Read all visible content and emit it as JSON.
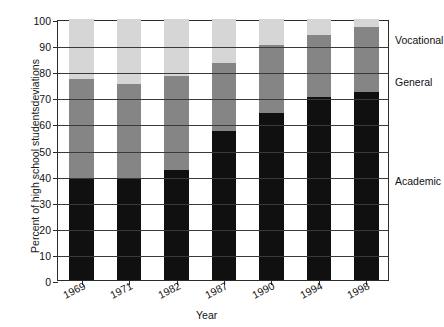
{
  "chart_data": {
    "type": "bar",
    "stacked": true,
    "title": "",
    "xlabel": "Year",
    "ylabel": "Percent of high school studentsdeviations",
    "categories": [
      "1969",
      "1971",
      "1982",
      "1987",
      "1990",
      "1994",
      "1998"
    ],
    "ylim": [
      0,
      100
    ],
    "yticks": [
      0,
      10,
      20,
      30,
      40,
      50,
      60,
      70,
      80,
      90,
      100
    ],
    "grid": true,
    "legend_position": "right-outside",
    "series": [
      {
        "name": "Academic",
        "color": "#101010",
        "values": [
          39,
          39,
          42,
          57,
          64,
          70,
          72
        ]
      },
      {
        "name": "General",
        "color": "#858585",
        "values": [
          38,
          36,
          36,
          26,
          26,
          24,
          25
        ]
      },
      {
        "name": "Vocational",
        "color": "#d6d6d6",
        "values": [
          23,
          25,
          22,
          17,
          10,
          6,
          3
        ]
      }
    ],
    "cumulative_tops": {
      "Academic": [
        39,
        39,
        42,
        57,
        64,
        70,
        72
      ],
      "General": [
        77,
        75,
        78,
        83,
        90,
        94,
        97
      ],
      "Vocational": [
        100,
        100,
        100,
        100,
        100,
        100,
        100
      ]
    },
    "series_label_positions": {
      "Vocational": 92,
      "General": 76,
      "Academic": 38
    }
  }
}
